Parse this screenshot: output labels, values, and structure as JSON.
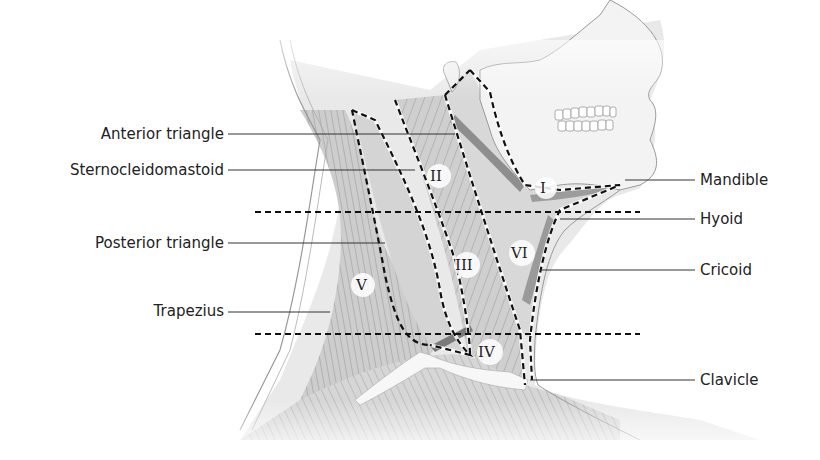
{
  "diagram": {
    "left_labels": [
      {
        "id": "anterior-triangle",
        "text": "Anterior triangle"
      },
      {
        "id": "sternocleidomastoid",
        "text": "Sternocleidomastoid"
      },
      {
        "id": "posterior-triangle",
        "text": "Posterior triangle"
      },
      {
        "id": "trapezius",
        "text": "Trapezius"
      }
    ],
    "right_labels": [
      {
        "id": "mandible",
        "text": "Mandible"
      },
      {
        "id": "hyoid",
        "text": "Hyoid"
      },
      {
        "id": "cricoid",
        "text": "Cricoid"
      },
      {
        "id": "clavicle",
        "text": "Clavicle"
      }
    ],
    "levels": [
      {
        "id": "level-1",
        "text": "I"
      },
      {
        "id": "level-2",
        "text": "II"
      },
      {
        "id": "level-3",
        "text": "III"
      },
      {
        "id": "level-4",
        "text": "IV"
      },
      {
        "id": "level-5",
        "text": "V"
      },
      {
        "id": "level-6",
        "text": "VI"
      }
    ],
    "colors": {
      "skin_outline": "#8a8a8a",
      "muscle_fill": "#c9c9c9",
      "triangle_fill": "#d9d9d9",
      "dashed_line": "#1a1a1a",
      "label_text": "#222222"
    }
  }
}
